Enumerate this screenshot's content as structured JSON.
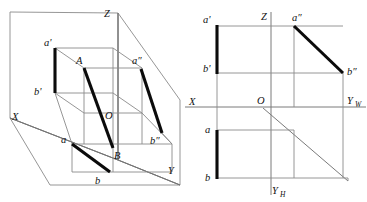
{
  "figure": {
    "stroke_thin": "#8a8a8a",
    "stroke_thick": "#0b0b0b",
    "background": "#ffffff"
  },
  "pictorial": {
    "name": "axonometric-octant-box",
    "labels": {
      "z_axis": "Z",
      "x_axis": "X",
      "y_axis": "Y",
      "origin": "O",
      "point_A": "A",
      "point_B": "B",
      "a_front": "a'",
      "b_front": "b'",
      "a_side": "a″",
      "b_side": "b″",
      "a_top": "a",
      "b_top": "b"
    }
  },
  "orthographic": {
    "name": "three-view-projection",
    "labels": {
      "z_axis": "Z",
      "x_axis": "X",
      "y_w_axis": "Y",
      "y_w_sub": "W",
      "y_h_axis": "Y",
      "y_h_sub": "H",
      "origin": "O",
      "a_front": "a'",
      "b_front": "b'",
      "a_side": "a″",
      "b_side": "b″",
      "a_top": "a",
      "b_top": "b"
    }
  }
}
